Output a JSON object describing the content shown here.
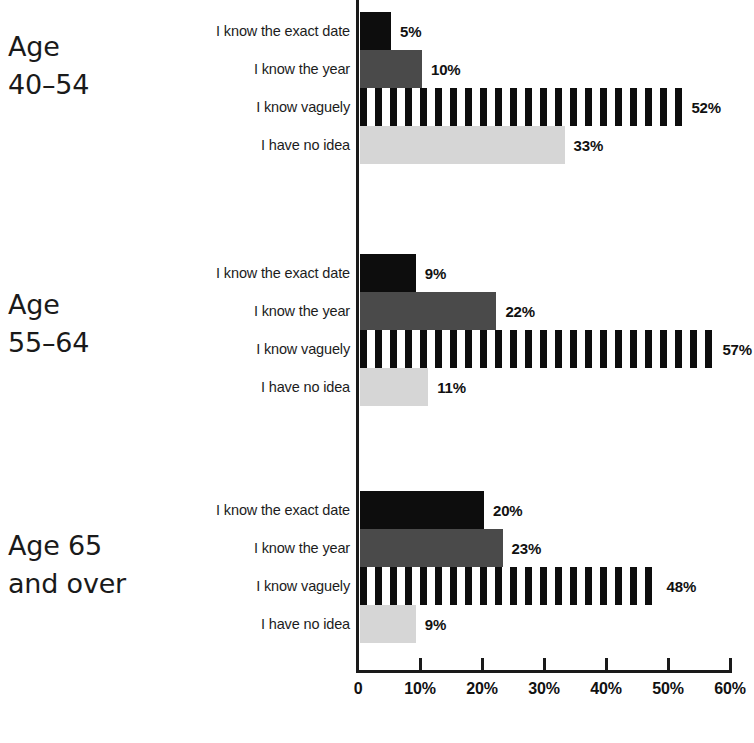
{
  "chart_data": {
    "type": "bar",
    "orientation": "horizontal",
    "title": "",
    "subtitle": "",
    "xlabel": "",
    "ylabel": "",
    "xlim": [
      0,
      60
    ],
    "grid": false,
    "legend_position": "none",
    "categories": [
      "I know the exact date",
      "I know the year",
      "I know vaguely",
      "I have no idea"
    ],
    "axis_ticks": [
      {
        "value": 0,
        "label": "0"
      },
      {
        "value": 10,
        "label": "10%"
      },
      {
        "value": 20,
        "label": "20%"
      },
      {
        "value": 30,
        "label": "30%"
      },
      {
        "value": 40,
        "label": "40%"
      },
      {
        "value": 50,
        "label": "50%"
      },
      {
        "value": 60,
        "label": "60%"
      }
    ],
    "series_styles": [
      {
        "category": "I know the exact date",
        "fill": "solid-black",
        "color": "#0d0d0d"
      },
      {
        "category": "I know the year",
        "fill": "solid-dark",
        "color": "#4a4a4a"
      },
      {
        "category": "I know vaguely",
        "fill": "striped",
        "color": "#0d0d0d"
      },
      {
        "category": "I have no idea",
        "fill": "solid-light",
        "color": "#d6d6d6"
      }
    ],
    "groups": [
      {
        "name": "Age 40–54",
        "label_line1": "Age",
        "label_line2": "40–54",
        "values": [
          5,
          10,
          52,
          33
        ],
        "value_labels": [
          "5%",
          "10%",
          "52%",
          "33%"
        ]
      },
      {
        "name": "Age 55–64",
        "label_line1": "Age",
        "label_line2": "55–64",
        "values": [
          9,
          22,
          57,
          11
        ],
        "value_labels": [
          "9%",
          "22%",
          "57%",
          "11%"
        ]
      },
      {
        "name": "Age 65 and over",
        "label_line1": "Age 65",
        "label_line2": "and over",
        "values": [
          20,
          23,
          48,
          9
        ],
        "value_labels": [
          "20%",
          "23%",
          "48%",
          "9%"
        ]
      }
    ]
  },
  "groups": [
    {
      "label": "Age\n40–54",
      "rows": [
        {
          "category": "I know the exact date",
          "value_label": "5%"
        },
        {
          "category": "I know the year",
          "value_label": "10%"
        },
        {
          "category": "I know vaguely",
          "value_label": "52%"
        },
        {
          "category": "I have no idea",
          "value_label": "33%"
        }
      ]
    },
    {
      "label": "Age\n55–64",
      "rows": [
        {
          "category": "I know the exact date",
          "value_label": "9%"
        },
        {
          "category": "I know the year",
          "value_label": "22%"
        },
        {
          "category": "I know vaguely",
          "value_label": "57%"
        },
        {
          "category": "I have no idea",
          "value_label": "11%"
        }
      ]
    },
    {
      "label": "Age 65\nand over",
      "rows": [
        {
          "category": "I know the exact date",
          "value_label": "20%"
        },
        {
          "category": "I know the year",
          "value_label": "23%"
        },
        {
          "category": "I know vaguely",
          "value_label": "48%"
        },
        {
          "category": "I have no idea",
          "value_label": "9%"
        }
      ]
    }
  ],
  "axis": {
    "tick_labels": [
      "0",
      "10%",
      "20%",
      "30%",
      "40%",
      "50%",
      "60%"
    ]
  }
}
